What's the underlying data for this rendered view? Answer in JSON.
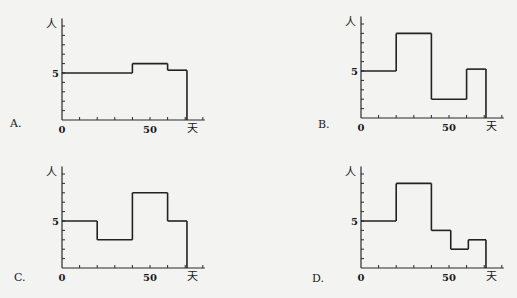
{
  "chart_data": [
    {
      "type": "line",
      "step": true,
      "option_label": "A.",
      "xlabel": "天",
      "ylabel": "人",
      "x_tick_labels": [
        "0",
        "50"
      ],
      "y_tick_labels": [
        "5"
      ],
      "xlim": [
        0,
        80
      ],
      "ylim": [
        0,
        10.8
      ],
      "x_tick_step": 10,
      "y_tick_step": 1,
      "segments": [
        {
          "x0": 0,
          "x1": 40,
          "y": 5
        },
        {
          "x0": 40,
          "x1": 60,
          "y": 6
        },
        {
          "x0": 60,
          "x1": 71,
          "y": 5.3
        }
      ]
    },
    {
      "type": "line",
      "step": true,
      "option_label": "B.",
      "xlabel": "天",
      "ylabel": "人",
      "x_tick_labels": [
        "0",
        "50"
      ],
      "y_tick_labels": [
        "5"
      ],
      "xlim": [
        0,
        80
      ],
      "ylim": [
        0,
        10.8
      ],
      "x_tick_step": 10,
      "y_tick_step": 1,
      "segments": [
        {
          "x0": 0,
          "x1": 20,
          "y": 5
        },
        {
          "x0": 20,
          "x1": 40,
          "y": 9
        },
        {
          "x0": 40,
          "x1": 60,
          "y": 2
        },
        {
          "x0": 60,
          "x1": 71,
          "y": 5.2
        }
      ]
    },
    {
      "type": "line",
      "step": true,
      "option_label": "C.",
      "xlabel": "天",
      "ylabel": "人",
      "x_tick_labels": [
        "0",
        "50"
      ],
      "y_tick_labels": [
        "5"
      ],
      "xlim": [
        0,
        80
      ],
      "ylim": [
        0,
        10.8
      ],
      "x_tick_step": 10,
      "y_tick_step": 1,
      "segments": [
        {
          "x0": 0,
          "x1": 20,
          "y": 5
        },
        {
          "x0": 20,
          "x1": 40,
          "y": 3
        },
        {
          "x0": 40,
          "x1": 60,
          "y": 8
        },
        {
          "x0": 60,
          "x1": 71,
          "y": 5
        }
      ]
    },
    {
      "type": "line",
      "step": true,
      "option_label": "D.",
      "xlabel": "天",
      "ylabel": "人",
      "x_tick_labels": [
        "0",
        "50"
      ],
      "y_tick_labels": [
        "5"
      ],
      "xlim": [
        0,
        80
      ],
      "ylim": [
        0,
        10.8
      ],
      "x_tick_step": 10,
      "y_tick_step": 1,
      "segments": [
        {
          "x0": 0,
          "x1": 20,
          "y": 5
        },
        {
          "x0": 20,
          "x1": 40,
          "y": 9
        },
        {
          "x0": 40,
          "x1": 51,
          "y": 4
        },
        {
          "x0": 51,
          "x1": 61,
          "y": 2
        },
        {
          "x0": 61,
          "x1": 71,
          "y": 3
        }
      ]
    }
  ]
}
